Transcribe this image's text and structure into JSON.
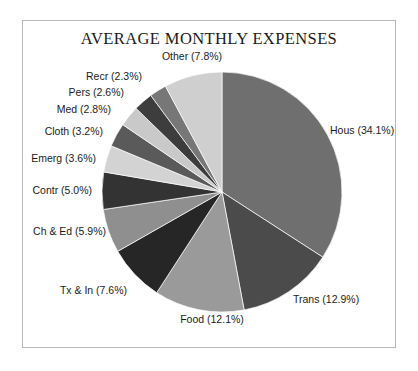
{
  "chart": {
    "title": "AVERAGE MONTHLY EXPENSES",
    "frame_color": "#b9b9b9",
    "background": "#ffffff",
    "text_color": "#1c1c1c"
  },
  "chart_data": {
    "type": "pie",
    "title": "AVERAGE MONTHLY EXPENSES",
    "xlabel": "",
    "ylabel": "",
    "start_angle_deg": 90,
    "direction": "clockwise",
    "legend": "none",
    "grid": false,
    "units": "percent",
    "categories": [
      "Hous",
      "Trans",
      "Food",
      "Tx & In",
      "Ch & Ed",
      "Contr",
      "Emerg",
      "Cloth",
      "Med",
      "Pers",
      "Recr",
      "Other"
    ],
    "values": [
      34.1,
      12.9,
      12.1,
      7.6,
      5.9,
      5.0,
      3.6,
      3.2,
      2.8,
      2.6,
      2.3,
      7.8
    ],
    "labels": [
      "Hous (34.1%)",
      "Trans (12.9%)",
      "Food (12.1%)",
      "Tx & In (7.6%)",
      "Ch & Ed (5.9%)",
      "Contr (5.0%)",
      "Emerg (3.6%)",
      "Cloth (3.2%)",
      "Med (2.8%)",
      "Pers (2.6%)",
      "Recr (2.3%)",
      "Other (7.8%)"
    ],
    "colors": [
      "#6f6f6f",
      "#4b4b4b",
      "#9a9a9a",
      "#262626",
      "#8f8f8f",
      "#333333",
      "#d3d3d3",
      "#5a5a5a",
      "#c9c9c9",
      "#3d3d3d",
      "#777777",
      "#cfcfcf"
    ]
  },
  "labels": {
    "hous": {
      "text": "Hous (34.1%)",
      "x": 330,
      "y": 130,
      "align": "left"
    },
    "trans": {
      "text": "Trans (12.9%)",
      "x": 293,
      "y": 299,
      "align": "left"
    },
    "food": {
      "text": "Food (12.1%)",
      "x": 212,
      "y": 319,
      "align": "center"
    },
    "txin": {
      "text": "Tx & In (7.6%)",
      "x": 127,
      "y": 290,
      "align": "right"
    },
    "ched": {
      "text": "Ch & Ed (5.9%)",
      "x": 106,
      "y": 231,
      "align": "right"
    },
    "contr": {
      "text": "Contr (5.0%)",
      "x": 92,
      "y": 190,
      "align": "right"
    },
    "emerg": {
      "text": "Emerg (3.6%)",
      "x": 96,
      "y": 158,
      "align": "right"
    },
    "cloth": {
      "text": "Cloth (3.2%)",
      "x": 103,
      "y": 131,
      "align": "right"
    },
    "med": {
      "text": "Med (2.8%)",
      "x": 111,
      "y": 109,
      "align": "right"
    },
    "pers": {
      "text": "Pers (2.6%)",
      "x": 124,
      "y": 92,
      "align": "right"
    },
    "recr": {
      "text": "Recr (2.3%)",
      "x": 142,
      "y": 76,
      "align": "right"
    },
    "other": {
      "text": "Other (7.8%)",
      "x": 192,
      "y": 56,
      "align": "center"
    }
  }
}
